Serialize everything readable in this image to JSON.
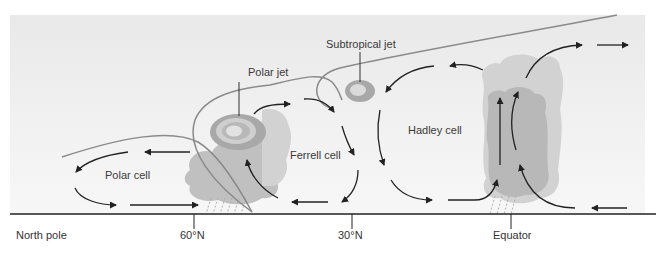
{
  "diagram": {
    "cells": [
      {
        "id": "polar",
        "label": "Polar cell"
      },
      {
        "id": "ferrell",
        "label": "Ferrell cell"
      },
      {
        "id": "hadley",
        "label": "Hadley cell"
      }
    ],
    "jets": [
      {
        "id": "polar",
        "label": "Polar jet"
      },
      {
        "id": "subtropical",
        "label": "Subtropical jet"
      }
    ],
    "axis": {
      "ticks": [
        {
          "label": "North pole"
        },
        {
          "label": "60°N"
        },
        {
          "label": "30°N"
        },
        {
          "label": "Equator"
        }
      ]
    },
    "colors": {
      "background_panel": "#ececec",
      "cloud": "#bdbdbd",
      "tropopause_line": "#8a8a8a",
      "jet_outer": "#a9a9a9",
      "jet_inner": "#d8d8d8",
      "arrows": "#222222",
      "ground_line": "#222222"
    }
  }
}
